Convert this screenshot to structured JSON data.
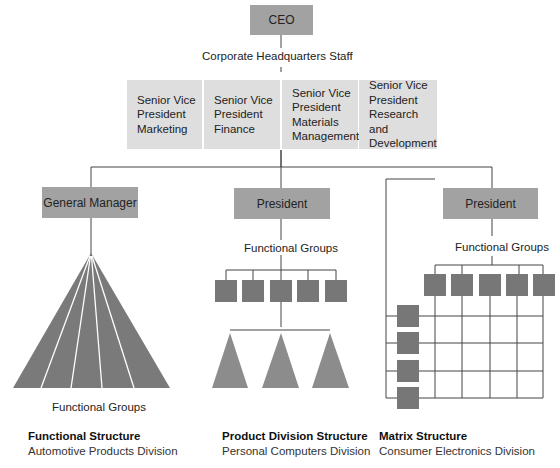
{
  "top": {
    "ceo": "CEO",
    "hq_staff": "Corporate Headquarters Staff",
    "svps": [
      {
        "lines": [
          "Senior Vice",
          "President",
          "Marketing"
        ]
      },
      {
        "lines": [
          "Senior Vice",
          "President",
          "Finance"
        ]
      },
      {
        "lines": [
          "Senior Vice",
          "President",
          "Materials",
          "Management"
        ]
      },
      {
        "lines": [
          "Senior Vice",
          "President",
          "Research and",
          "Development"
        ]
      }
    ]
  },
  "divisions": [
    {
      "head": "General Manager",
      "groups_label": "Functional Groups",
      "title": "Functional Structure",
      "subtitle": "Automotive Products Division"
    },
    {
      "head": "President",
      "groups_label": "Functional Groups",
      "title": "Product Division Structure",
      "subtitle": "Personal Computers Division"
    },
    {
      "head": "President",
      "groups_label": "Functional Groups",
      "title": "Matrix Structure",
      "subtitle": "Consumer Electronics Division"
    }
  ],
  "colors": {
    "dark_box": "#a2a2a2",
    "light_box": "#dcdcdc",
    "func_square": "#777777",
    "triangle": "#888888",
    "pyramid": "#7a7a7a",
    "line": "#444444"
  }
}
